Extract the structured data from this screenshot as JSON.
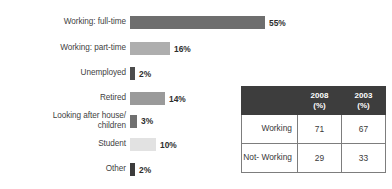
{
  "chart_data": {
    "type": "bar",
    "orientation": "horizontal",
    "title": "",
    "xlabel": "",
    "ylabel": "",
    "xlim": [
      0,
      55
    ],
    "grid": false,
    "legend": "none",
    "value_suffix": "%",
    "categories": [
      "Working: full-time",
      "Working: part-time",
      "Unemployed",
      "Retired",
      "Looking after house/\nchildren",
      "Student",
      "Other"
    ],
    "values": [
      55,
      16,
      2,
      14,
      3,
      10,
      2
    ],
    "value_labels": [
      "55%",
      "16%",
      "2%",
      "14%",
      "3%",
      "10%",
      "2%"
    ],
    "bar_colors": [
      "#6e6e6e",
      "#aeaeae",
      "#4c4c4c",
      "#9a9a9a",
      "#707070",
      "#e2e2e2",
      "#3c3c3c"
    ]
  },
  "bars": [
    {
      "label": "Working: full-time",
      "value_label": "55%",
      "width_px": 135,
      "color": "#6e6e6e",
      "top": 14,
      "height": 17
    },
    {
      "label": "Working: part-time",
      "value_label": "16%",
      "width_px": 40,
      "color": "#aeaeae",
      "top": 40,
      "height": 17
    },
    {
      "label": "Unemployed",
      "value_label": "2%",
      "width_px": 5,
      "color": "#4c4c4c",
      "top": 65,
      "height": 17
    },
    {
      "label": "Retired",
      "value_label": "14%",
      "width_px": 35,
      "color": "#9a9a9a",
      "top": 90,
      "height": 17
    },
    {
      "label": "Looking after house/\nchildren",
      "value_label": "3%",
      "width_px": 7,
      "color": "#707070",
      "top": 110,
      "height": 22
    },
    {
      "label": "Student",
      "value_label": "10%",
      "width_px": 26,
      "color": "#e2e2e2",
      "top": 136,
      "height": 17
    },
    {
      "label": "Other",
      "value_label": "2%",
      "width_px": 5,
      "color": "#3c3c3c",
      "top": 161,
      "height": 17
    }
  ],
  "table": {
    "corner_header": "",
    "column_headers": [
      {
        "year": "2008",
        "unit": "(%)"
      },
      {
        "year": "2003",
        "unit": "(%)"
      }
    ],
    "rows": [
      {
        "label": "Working",
        "values": [
          "71",
          "67"
        ]
      },
      {
        "label": "Not-\nWorking",
        "values": [
          "29",
          "33"
        ]
      }
    ]
  },
  "colors": {
    "table_header_bg": "#3d3d3d",
    "table_header_text": "#ffffff",
    "table_border": "#7d7d7d",
    "text": "#3a3a3a",
    "background": "#ffffff"
  }
}
